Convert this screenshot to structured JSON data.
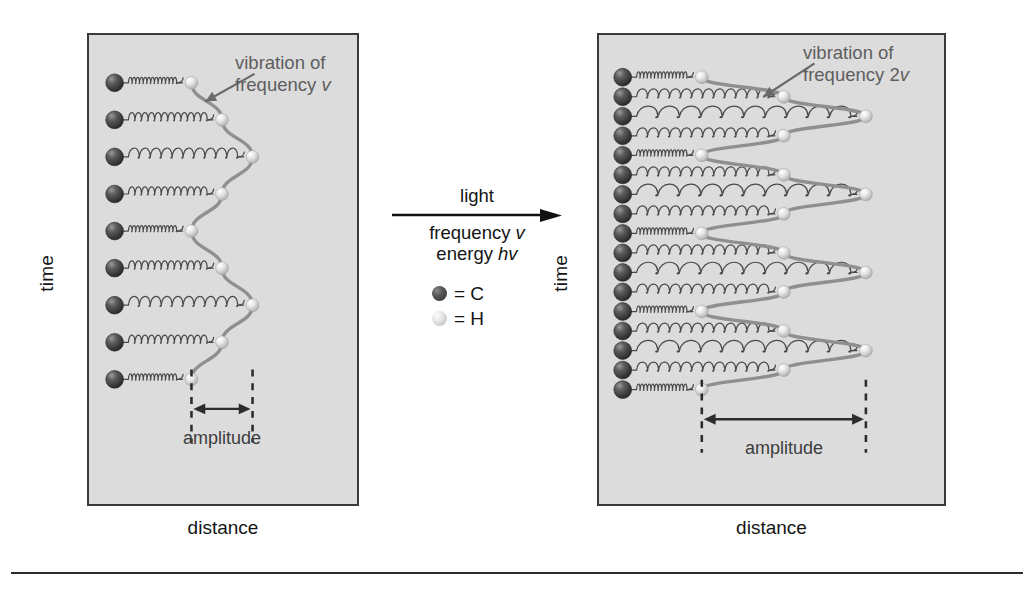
{
  "figure": {
    "background_color": "#ffffff",
    "panel_fill": "#dcdcdc",
    "panel_border_color": "#3a3a3a",
    "carbon_color": "#2f2f2f",
    "hydrogen_color": "#e2e2e2",
    "wave_color": "#6e6e6e",
    "spring_color": "#4a4a4a"
  },
  "left_panel": {
    "name": "before-absorption",
    "axis_y_label": "time",
    "axis_x_label": "distance",
    "callout_line1": "vibration of",
    "callout_line2_pre": "frequency ",
    "callout_line2_sym": "v",
    "amplitude_label": "amplitude",
    "rows": 9,
    "wave_cycles": 2,
    "amplitude_px": 30
  },
  "right_panel": {
    "name": "after-absorption",
    "axis_y_label": "time",
    "axis_x_label": "distance",
    "callout_line1": "vibration of",
    "callout_line2_pre": "frequency 2",
    "callout_line2_sym": "v",
    "amplitude_label": "amplitude",
    "rows": 17,
    "wave_cycles": 4,
    "amplitude_px": 88
  },
  "reaction": {
    "top_label": "light",
    "bottom_line1_pre": "frequency ",
    "bottom_line1_sym": "v",
    "bottom_line2_pre": "energy ",
    "bottom_line2_sym": "hv"
  },
  "legend": {
    "items": [
      {
        "symbol_name": "carbon-sphere",
        "equals": "= C",
        "color": "#2f2f2f"
      },
      {
        "symbol_name": "hydrogen-sphere",
        "equals": "= H",
        "color": "#e2e2e2"
      }
    ]
  }
}
